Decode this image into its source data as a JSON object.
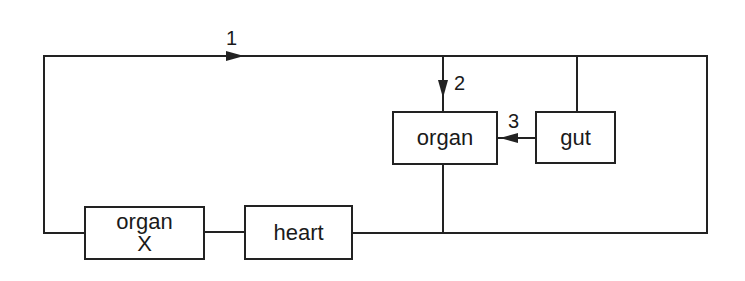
{
  "diagram": {
    "type": "circulation-flow-diagram",
    "nodes": [
      {
        "id": "organ_x",
        "label_line1": "organ",
        "label_line2": "X"
      },
      {
        "id": "heart",
        "label": "heart"
      },
      {
        "id": "organ",
        "label": "organ"
      },
      {
        "id": "gut",
        "label": "gut"
      }
    ],
    "flow_labels": {
      "flow1": "1",
      "flow2": "2",
      "flow3": "3"
    },
    "edges": [
      {
        "from": "organ_x",
        "to": "top_line",
        "label": "1",
        "direction": "right"
      },
      {
        "from": "top_line",
        "to": "organ",
        "label": "2",
        "direction": "down"
      },
      {
        "from": "gut",
        "to": "organ",
        "label": "3",
        "direction": "left"
      },
      {
        "from": "top_line",
        "to": "gut",
        "label": ""
      },
      {
        "from": "organ",
        "to": "bottom_line",
        "label": ""
      },
      {
        "from": "heart",
        "to": "bottom_line",
        "label": ""
      },
      {
        "from": "organ_x",
        "to": "heart",
        "label": ""
      }
    ],
    "colors": {
      "line": "#222222",
      "background": "#ffffff"
    }
  }
}
